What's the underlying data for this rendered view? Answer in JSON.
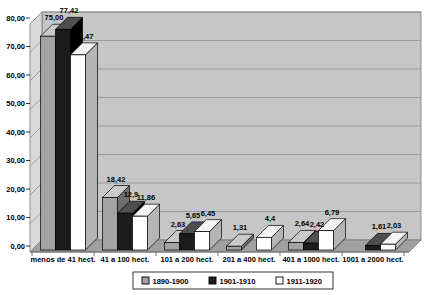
{
  "chart_data": {
    "type": "bar",
    "style": "3d-column",
    "title": "",
    "xlabel": "",
    "ylabel": "",
    "categories": [
      "menos de 41 hect.",
      "41 a 100 hect.",
      "101 a 200 hect.",
      "201 a 400 hect.",
      "401 a 1000 hect.",
      "1001 a 2000 hect."
    ],
    "series": [
      {
        "name": "1890-1900",
        "values": [
          75.0,
          18.42,
          2.63,
          1.31,
          2.64,
          0
        ],
        "value_labels": [
          "75,00",
          "18,42",
          "2,63",
          "1,31",
          "2,64",
          ""
        ],
        "color_front": "#a3a3a3",
        "color_top": "#c9c9c9",
        "color_side": "#6e6e6e"
      },
      {
        "name": "1901-1910",
        "values": [
          77.42,
          12.9,
          5.65,
          0,
          2.42,
          1.61
        ],
        "value_labels": [
          "77,42",
          "12,9",
          "5,65",
          "",
          "2,42",
          "1,61"
        ],
        "color_front": "#1c1c1c",
        "color_top": "#4f4f4f",
        "color_side": "#000000"
      },
      {
        "name": "1911-1920",
        "values": [
          68.47,
          11.86,
          6.45,
          4.4,
          6.79,
          2.03
        ],
        "value_labels": [
          "68,47",
          "11,86",
          "6,45",
          "4,4",
          "6,79",
          "2,03"
        ],
        "color_front": "#ffffff",
        "color_top": "#f4f4f4",
        "color_side": "#b5b5b5"
      }
    ],
    "ylim": [
      0,
      80
    ],
    "ytick_values": [
      0,
      10,
      20,
      30,
      40,
      50,
      60,
      70,
      80
    ],
    "ytick_labels": [
      "0,00",
      "10,00",
      "20,00",
      "30,00",
      "40,00",
      "50,00",
      "60,00",
      "70,00",
      "80,00"
    ],
    "grid": true,
    "legend_position": "bottom",
    "colors": {
      "background": "#ffffff",
      "back_wall": "#c6c6c6",
      "side_wall": "#d9d9d9",
      "floor": "#a0a0a0",
      "gridline": "#8f8f8f",
      "wall_edge": "#7a7a7a",
      "bar_outline": "#000000",
      "legend_bg": "#ffffff",
      "legend_border": "#000000",
      "text": "#000000"
    }
  }
}
